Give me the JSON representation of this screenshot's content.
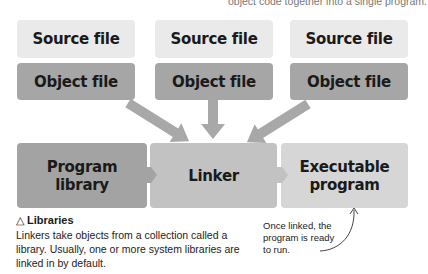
{
  "caption_top": "object code together into a single program.",
  "columns": [
    {
      "source_label": "Source file",
      "object_label": "Object file"
    },
    {
      "source_label": "Source file",
      "object_label": "Object file"
    },
    {
      "source_label": "Source file",
      "object_label": "Object file"
    }
  ],
  "bottom_row": {
    "library_line1": "Program",
    "library_line2": "library",
    "linker": "Linker",
    "executable_line1": "Executable",
    "executable_line2": "program"
  },
  "note": {
    "icon": "triangle-up-icon",
    "icon_glyph": "△",
    "title": "Libraries",
    "body": "Linkers take objects from a collection called a library. Usually, one or more system libraries are linked in by default."
  },
  "side_note": "Once linked, the program is ready to run.",
  "colors": {
    "source_box": "#eaeaea",
    "object_box": "#a6a6a6",
    "library_box": "#a3a3a3",
    "linker_box": "#c2c2c2",
    "executable_box": "#d6d6d6",
    "arrow": "#a8a8a8"
  }
}
